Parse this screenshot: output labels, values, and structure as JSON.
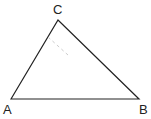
{
  "diagram": {
    "type": "triangle",
    "vertices": [
      {
        "label": "A",
        "x": 11,
        "y": 99,
        "label_x": 3,
        "label_y": 114
      },
      {
        "label": "B",
        "x": 139,
        "y": 99,
        "label_x": 139,
        "label_y": 114
      },
      {
        "label": "C",
        "x": 58,
        "y": 20,
        "label_x": 53,
        "label_y": 14
      }
    ],
    "edges": [
      [
        "A",
        "C"
      ],
      [
        "C",
        "B"
      ],
      [
        "A",
        "B"
      ]
    ],
    "auxiliary_line": {
      "style": "dashed",
      "x1": 48,
      "y1": 37,
      "x2": 68,
      "y2": 55
    },
    "colors": {
      "stroke": "#222222",
      "dashed": "#cccccc",
      "background": "#ffffff"
    }
  }
}
